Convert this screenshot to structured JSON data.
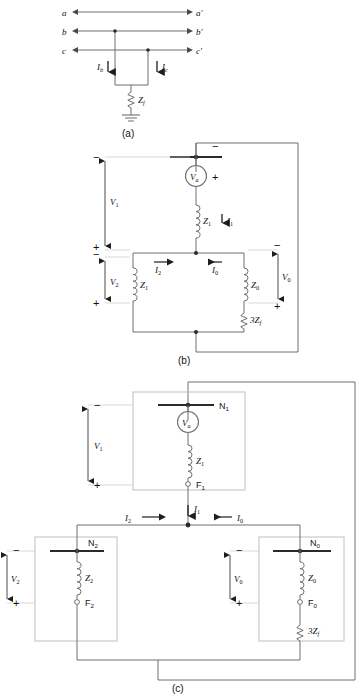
{
  "figure": {
    "panels": [
      {
        "id": "a",
        "caption": "(a)",
        "description": "Three-phase line diagram with double line-to-ground fault through Zf",
        "terminals_left": [
          "a",
          "b",
          "c"
        ],
        "terminals_right": [
          "a'",
          "b'",
          "c'"
        ],
        "currents": [
          "I_b",
          "I_c"
        ],
        "impedance": "Z_f",
        "ground_symbol": "earth-ground"
      },
      {
        "id": "b",
        "caption": "(b)",
        "description": "Interconnected sequence impedance network",
        "source": "V_a",
        "impedances": [
          "Z_1",
          "Z_1",
          "Z_0",
          "3Z_f"
        ],
        "currents": [
          "I_1",
          "I_2",
          "I_0"
        ],
        "voltages": [
          "V_1",
          "V_2",
          "V_0"
        ],
        "polarity_marks": [
          "-",
          "+",
          "+",
          "-",
          "-",
          "+"
        ]
      },
      {
        "id": "c",
        "caption": "(c)",
        "description": "Sequence networks shown as boxes with node and fault terminals",
        "networks": [
          {
            "node": "N_1",
            "fault": "F_1",
            "impedance": "Z_1",
            "voltage": "V_1",
            "source": "V_a"
          },
          {
            "node": "N_2",
            "fault": "F_2",
            "impedance": "Z_2",
            "voltage": "V_2",
            "source": null
          },
          {
            "node": "N_0",
            "fault": "F_0",
            "impedance": "Z_0",
            "voltage": "V_0",
            "source": null
          }
        ],
        "fault_impedance": "3Z_f",
        "currents": [
          "I_1",
          "I_2",
          "I_0"
        ]
      }
    ],
    "labels": {
      "a": "a",
      "a_prime": "a'",
      "b": "b",
      "b_prime": "b'",
      "c": "c",
      "c_prime": "c'",
      "Ib": "I",
      "Ib_sub": "b",
      "Ic": "I",
      "Ic_sub": "c",
      "Zf": "Z",
      "Zf_sub": "f",
      "Va": "V",
      "Va_sub": "a",
      "Z1": "Z",
      "Z1_sub": "1",
      "Z2": "Z",
      "Z2_sub": "2",
      "Z0": "Z",
      "Z0_sub": "0",
      "threeZf": "3Z",
      "threeZf_sub": "f",
      "I1": "I",
      "I1_sub": "1",
      "I2": "I",
      "I2_sub": "2",
      "I0": "I",
      "I0_sub": "0",
      "V1": "V",
      "V1_sub": "1",
      "V2": "V",
      "V2_sub": "2",
      "V0": "V",
      "V0_sub": "0",
      "N1": "N",
      "N1_sub": "1",
      "N2": "N",
      "N2_sub": "2",
      "N0": "N",
      "N0_sub": "0",
      "F1": "F",
      "F1_sub": "1",
      "F2": "F",
      "F2_sub": "2",
      "F0": "F",
      "F0_sub": "0",
      "plus": "+",
      "minus": "−",
      "caption_a": "(a)",
      "caption_b": "(b)",
      "caption_c": "(c)"
    },
    "colors": {
      "wire": "#6e6e6e",
      "wire_dark": "#3a3a3a",
      "box": "#b8b8b8",
      "bus": "#2a2a2a",
      "text": "#111111",
      "background": "#ffffff"
    }
  }
}
